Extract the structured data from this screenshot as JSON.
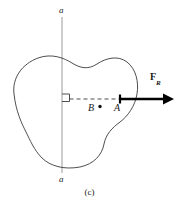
{
  "figure": {
    "caption": "(c)",
    "domain_type": "mechanics-free-body-diagram",
    "axis": {
      "name": "axis-a-a",
      "label_top": "a",
      "label_bottom": "a",
      "x": 62,
      "y_top": 17,
      "y_bottom": 173,
      "color": "#9a9a9a",
      "width": 1
    },
    "body": {
      "name": "irregular-rigid-body",
      "outline_color": "#3a3a3a",
      "fill": "none",
      "stroke_width": 0.9,
      "path": "M 14 94 C 12 78 22 64 38 58 C 52 53 64 58 72 63 C 80 68 88 70 97 64 C 106 58 118 55 127 62 C 136 69 139 82 137 94 C 135 106 128 116 120 122 C 112 128 106 134 104 144 C 102 155 94 164 80 167 C 64 170 50 166 42 158 C 34 150 30 140 26 132 C 22 124 16 112 14 94 Z"
    },
    "dashed_line": {
      "name": "moment-arm-dashed-line",
      "x1": 68,
      "y1": 99,
      "x2": 122,
      "y2": 99,
      "color": "#3a3a3a",
      "dash": "4 3"
    },
    "right_angle_marker": {
      "name": "right-angle-square",
      "x": 62,
      "y": 94,
      "size": 7,
      "color": "#3a3a3a"
    },
    "points": [
      {
        "name": "point-b",
        "label": "B",
        "cx": 100,
        "cy": 107,
        "r": 1.7,
        "color": "#111111"
      },
      {
        "name": "point-a",
        "label": "A",
        "cx": 120,
        "cy": 99,
        "r": 0.0,
        "color": "#111111"
      }
    ],
    "force_arrow": {
      "name": "resultant-force-arrow",
      "label": "F",
      "label_subscript": "R",
      "x_tail": 120,
      "x_head": 172,
      "y": 99,
      "shaft_width": 2.4,
      "color": "#000000",
      "tail_cap_height": 9
    }
  }
}
